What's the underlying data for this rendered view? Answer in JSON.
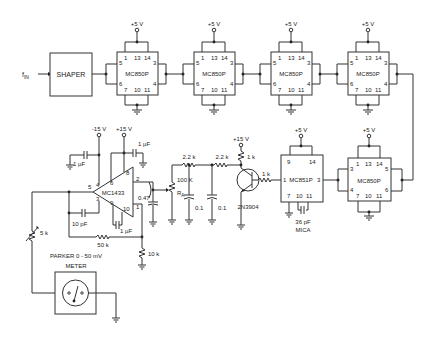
{
  "diagram": {
    "input": {
      "label": "f",
      "sub": "IN"
    },
    "shaper": {
      "label": "SHAPER"
    },
    "supply_5v": "+5 V",
    "chips_top": [
      {
        "label": "MC850P",
        "pins_top": [
          "1",
          "13",
          "14"
        ],
        "pins_left": [
          "5",
          "6"
        ],
        "pins_right": [
          "3",
          "4"
        ],
        "pins_bottom": [
          "7",
          "10",
          "11"
        ]
      },
      {
        "label": "MC850P",
        "pins_top": [
          "1",
          "13",
          "14"
        ],
        "pins_left": [
          "5",
          "6"
        ],
        "pins_right": [
          "3",
          "4"
        ],
        "pins_bottom": [
          "7",
          "10",
          "11"
        ]
      },
      {
        "label": "MC850P",
        "pins_top": [
          "1",
          "13",
          "14"
        ],
        "pins_left": [
          "5",
          "6"
        ],
        "pins_right": [
          "3",
          "4"
        ],
        "pins_bottom": [
          "7",
          "10",
          "11"
        ]
      },
      {
        "label": "MC850P",
        "pins_top": [
          "1",
          "13",
          "14"
        ],
        "pins_left": [
          "5",
          "6"
        ],
        "pins_right": [
          "3",
          "4"
        ],
        "pins_bottom": [
          "7",
          "10",
          "11"
        ]
      }
    ],
    "chip_bottom_right": {
      "label": "MC850P",
      "pins_top": [
        "1",
        "13",
        "14"
      ],
      "pins_left": [
        "3",
        "4"
      ],
      "pins_right": [
        "5",
        "6"
      ],
      "pins_bottom": [
        "7",
        "10",
        "11"
      ]
    },
    "oneshot": {
      "label": "MC851P",
      "pins_top": [
        "9",
        "14"
      ],
      "pin_in": "1",
      "pin_out": "3",
      "pins_bottom": [
        "7",
        "10",
        "11"
      ],
      "cap": "36 pF",
      "cap_type": "MICA"
    },
    "transistor": {
      "label": "2N3904",
      "r_collector": "1 k",
      "r_base": "1 k",
      "supply": "+15 V"
    },
    "filter": {
      "r1": "2.2 k",
      "r2": "2.2 k",
      "c1": "0.1",
      "c2": "0.1"
    },
    "pot": {
      "value": "100 K",
      "label": "R",
      "label_sub": "A"
    },
    "opamp": {
      "label": "MC1433",
      "neg_supply": "-15 V",
      "pos_supply": "+15 V",
      "pins": {
        "p4": "4",
        "p5": "5",
        "p3": "3",
        "p6": "6",
        "p9": "9",
        "p8": "8",
        "p2": "2",
        "p10": "10",
        "p1": "1"
      },
      "c_neg": "1 µF",
      "c_pos": "1 µF",
      "c_comp": "10 pF",
      "c_fb": "1 µF",
      "r_fb": "50 k",
      "r_out": "10 k",
      "c_out": "0.47"
    },
    "meter": {
      "line1": "PARKER 0 - 50 mV",
      "line2": "METER",
      "r_series": "5 k"
    }
  }
}
